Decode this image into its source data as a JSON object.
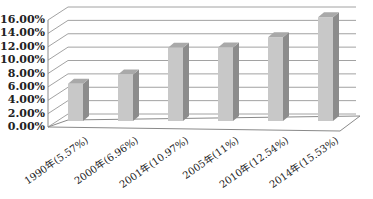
{
  "chart_data": {
    "type": "bar",
    "style": "3d-column",
    "title": "",
    "xlabel": "",
    "ylabel": "",
    "categories": [
      "1990年(5.57%)",
      "2000年(6.96%)",
      "2001年(10.97%)",
      "2005年(11%)",
      "2010年(12.54%)",
      "2014年(15.53%)"
    ],
    "values": [
      5.57,
      6.96,
      10.97,
      11.0,
      12.54,
      15.53
    ],
    "ylim": [
      0,
      16
    ],
    "y_ticks": [
      "0.00%",
      "2.00%",
      "4.00%",
      "6.00%",
      "8.00%",
      "10.00%",
      "12.00%",
      "14.00%",
      "16.00%"
    ],
    "grid": true,
    "legend": "none",
    "colors": {
      "bar_front": "#c8c8c8",
      "bar_side": "#8c8c8c",
      "bar_top": "#a9a9a9",
      "grid": "#8a8a8a"
    }
  }
}
